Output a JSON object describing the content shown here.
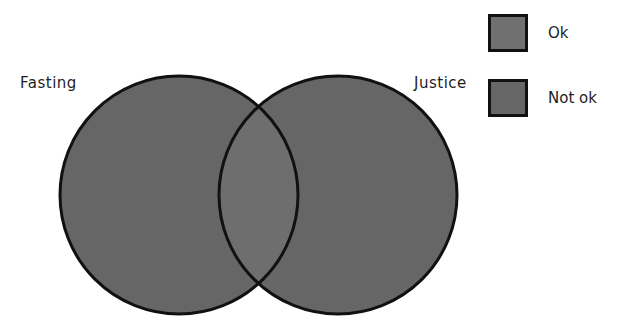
{
  "diagram": {
    "type": "venn",
    "sets": [
      {
        "name": "Fasting",
        "label": "Fasting",
        "status": "Not ok"
      },
      {
        "name": "Justice",
        "label": "Justice",
        "status": "Not ok"
      }
    ],
    "intersection": {
      "sets": [
        "Fasting",
        "Justice"
      ],
      "status": "Ok"
    }
  },
  "legend": {
    "items": [
      {
        "label": "Ok",
        "color": "#707070"
      },
      {
        "label": "Not ok",
        "color": "#666666"
      }
    ]
  },
  "colors": {
    "fill_not_ok": "#666666",
    "fill_ok": "#707070",
    "stroke": "#111111"
  }
}
